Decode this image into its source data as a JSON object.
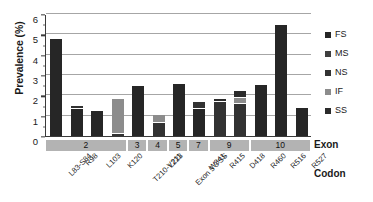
{
  "chart_data": {
    "type": "bar",
    "subtype": "stacked-bar",
    "title": "",
    "xlabel": "Codon",
    "ylabel": "Prevalence (%)",
    "ylim": [
      0,
      6
    ],
    "y_ticks": [
      0,
      1,
      2,
      3,
      4,
      5,
      6
    ],
    "grid": true,
    "legend_position": "right",
    "categories": [
      "L83-S84",
      "R98",
      "L103",
      "K120",
      "T210-V211",
      "L223",
      "Exon 5 3'SS",
      "W341",
      "R415",
      "D418",
      "R460",
      "R516",
      "R527"
    ],
    "series": [
      {
        "name": "FS",
        "values": [
          4.75,
          1.35,
          1.22,
          0.0,
          2.45,
          0.0,
          2.55,
          1.35,
          0.0,
          0.0,
          2.53,
          5.45,
          1.38
        ]
      },
      {
        "name": "MS",
        "values": [
          0.0,
          0.0,
          0.0,
          0.0,
          0.0,
          0.0,
          0.0,
          0.0,
          0.0,
          0.0,
          0.0,
          0.0,
          0.0
        ]
      },
      {
        "name": "NS",
        "values": [
          0.0,
          0.12,
          0.0,
          0.12,
          0.0,
          0.62,
          0.0,
          0.3,
          1.68,
          1.55,
          0.0,
          0.0,
          0.0
        ]
      },
      {
        "name": "IF",
        "values": [
          0.0,
          0.0,
          0.0,
          1.7,
          0.0,
          0.42,
          0.0,
          0.0,
          0.0,
          0.32,
          0.0,
          0.0,
          0.0
        ]
      },
      {
        "name": "SS",
        "values": [
          0.0,
          0.0,
          0.0,
          0.0,
          0.0,
          0.0,
          0.0,
          0.0,
          0.15,
          0.32,
          0.0,
          0.0,
          0.0
        ]
      }
    ],
    "totals": [
      4.75,
      1.47,
      1.22,
      1.82,
      2.45,
      1.04,
      2.55,
      1.65,
      1.83,
      2.19,
      2.53,
      5.45,
      1.38
    ],
    "exon_groups": [
      {
        "label": "2",
        "span": 4
      },
      {
        "label": "3",
        "span": 1
      },
      {
        "label": "4",
        "span": 1
      },
      {
        "label": "5",
        "span": 1
      },
      {
        "label": "7",
        "span": 1
      },
      {
        "label": "9",
        "span": 2
      },
      {
        "label": "10",
        "span": 3
      }
    ],
    "row_labels": {
      "exon": "Exon",
      "codon": "Codon"
    }
  },
  "legend": {
    "items": [
      {
        "label": "FS",
        "color": "#262626"
      },
      {
        "label": "MS",
        "color": "#3f3f3f"
      },
      {
        "label": "NS",
        "color": "#323232"
      },
      {
        "label": "IF",
        "color": "#8c8c8c"
      },
      {
        "label": "SS",
        "color": "#2b2b2b"
      }
    ]
  },
  "colors": {
    "FS": "#262626",
    "MS": "#3f3f3f",
    "NS": "#323232",
    "IF": "#8c8c8c",
    "SS": "#2b2b2b",
    "axis": "#3a3a3a",
    "grid": "#a6a6a6",
    "exon_band": "#b3b3b3"
  }
}
